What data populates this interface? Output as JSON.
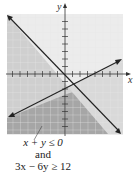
{
  "graph": {
    "x_axis_label": "x",
    "y_axis_label": "y",
    "lines": [
      {
        "equation": "x + y = 0",
        "boundary": "solid"
      },
      {
        "equation": "3x - 6y = 12",
        "boundary": "solid"
      }
    ],
    "shading": {
      "region": "x + y ≤ 0 and 3x - 6y ≥ 12",
      "color": "#a9a9a9",
      "light_color": "#dcdcdc"
    }
  },
  "caption": {
    "line1": "x + y ≤ 0",
    "line2": "and",
    "line3": "3x − 6y ≥ 12"
  }
}
